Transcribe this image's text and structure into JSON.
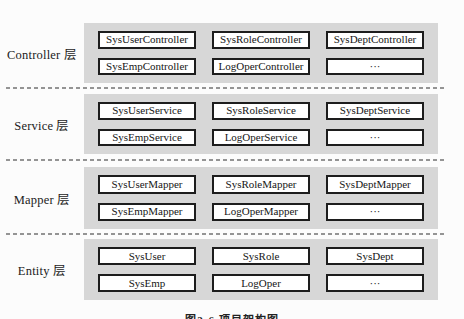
{
  "figure": {
    "caption": "图2-6 项目架构图"
  },
  "colors": {
    "page_bg": "#fcfcfc",
    "band_bg": "#d7d7d7",
    "box_bg": "#ffffff",
    "box_border": "#1d1d1d",
    "text": "#1b1b1b",
    "dashed_line": "#949494"
  },
  "layers": [
    {
      "label": "Controller 层",
      "boxes": [
        "SysUserController",
        "SysRoleController",
        "SysDeptController",
        "SysEmpController",
        "LogOperController",
        "···"
      ]
    },
    {
      "label": "Service 层",
      "boxes": [
        "SysUserService",
        "SysRoleService",
        "SysDeptService",
        "SysEmpService",
        "LogOperService",
        "···"
      ]
    },
    {
      "label": "Mapper 层",
      "boxes": [
        "SysUserMapper",
        "SysRoleMapper",
        "SysDeptMapper",
        "SysEmpMapper",
        "LogOperMapper",
        "···"
      ]
    },
    {
      "label": "Entity 层",
      "boxes": [
        "SysUser",
        "SysRole",
        "SysDept",
        "SysEmp",
        "LogOper",
        "···"
      ]
    }
  ]
}
